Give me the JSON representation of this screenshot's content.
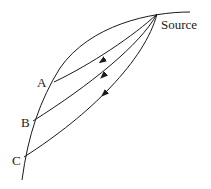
{
  "diagram": {
    "labels": {
      "source": "Source",
      "a": "A",
      "b": "B",
      "c": "C"
    },
    "colors": {
      "stroke": "#1a1a1a",
      "background": "#ffffff"
    },
    "nodes": [
      {
        "id": "source",
        "label": "Source"
      },
      {
        "id": "A",
        "label": "A"
      },
      {
        "id": "B",
        "label": "B"
      },
      {
        "id": "C",
        "label": "C"
      }
    ],
    "edges": [
      {
        "from": "source",
        "to": "A",
        "arrow": true
      },
      {
        "from": "source",
        "to": "B",
        "arrow": true
      },
      {
        "from": "source",
        "to": "C",
        "arrow": true
      }
    ]
  }
}
